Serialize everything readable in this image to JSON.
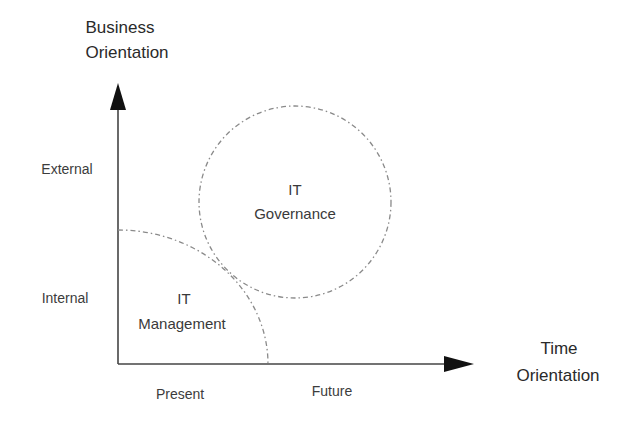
{
  "diagram": {
    "y_axis": {
      "title_line1": "Business",
      "title_line2": "Orientation",
      "levels": [
        "External",
        "Internal"
      ]
    },
    "x_axis": {
      "title_line1": "Time",
      "title_line2": "Orientation",
      "levels": [
        "Present",
        "Future"
      ]
    },
    "regions": [
      {
        "line1": "IT",
        "line2": "Management",
        "quadrant": "Internal / Present",
        "shape": "quarter-ellipse"
      },
      {
        "line1": "IT",
        "line2": "Governance",
        "quadrant": "External / Future",
        "shape": "circle"
      }
    ],
    "colors": {
      "axis": "#444444",
      "dashed_outline": "#8a8a8a",
      "text": "#3a3a3a"
    }
  }
}
